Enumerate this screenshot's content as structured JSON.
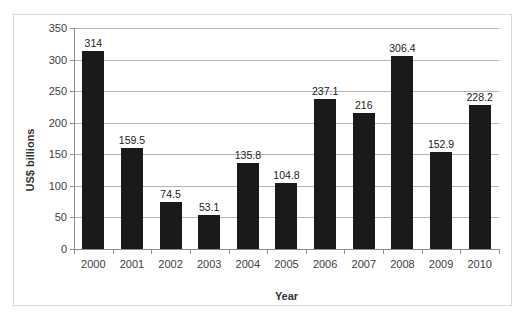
{
  "chart_data": {
    "type": "bar",
    "title": "",
    "subtitle": "",
    "xlabel": "Year",
    "ylabel": "US$ billions",
    "categories": [
      "2000",
      "2001",
      "2002",
      "2003",
      "2004",
      "2005",
      "2006",
      "2007",
      "2008",
      "2009",
      "2010"
    ],
    "values": [
      314,
      159.5,
      74.5,
      53.1,
      135.8,
      104.8,
      237.1,
      216,
      306.4,
      152.9,
      228.2
    ],
    "data_labels": [
      "314",
      "159.5",
      "74.5",
      "53.1",
      "135.8",
      "104.8",
      "237.1",
      "216",
      "306.4",
      "152.9",
      "228.2"
    ],
    "ylim": [
      0,
      350
    ],
    "ytick_values": [
      0,
      50,
      100,
      150,
      200,
      250,
      300,
      350
    ],
    "ytick_labels": [
      "0",
      "50",
      "100",
      "150",
      "200",
      "250",
      "300",
      "350"
    ],
    "grid": true,
    "grid_axis": "y",
    "legend": false,
    "legend_position": "none",
    "bar_color": "#1a1a1a",
    "gridline_color": "#b3b3b3",
    "axis_color": "#8c8c8c",
    "plot_background": "#ffffff",
    "border_color": "#d9d9d9"
  }
}
